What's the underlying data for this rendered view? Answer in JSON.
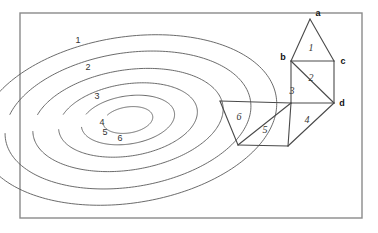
{
  "figure": {
    "width": 378,
    "height": 233,
    "background_color": "#ffffff",
    "frame": {
      "x": 20,
      "y": 13,
      "width": 342,
      "height": 205,
      "stroke_color": "#8a8a8a"
    },
    "colors": {
      "contour_stroke": "#5a5a5a",
      "mesh_stroke": "#4a4a4a",
      "label_text": "#333333",
      "vertex_text": "#111111"
    }
  },
  "contours": {
    "description": "six nested concentric tilted ellipses, outermost labelled 1 through innermost labelled 6",
    "center_x": 128,
    "center_y": 120,
    "rotation_deg": -9,
    "levels": [
      {
        "label": "1",
        "rx": 150,
        "ry": 83,
        "label_x": 78,
        "label_y": 41,
        "gap_start_deg": 185,
        "gap_end_deg": 199
      },
      {
        "label": "2",
        "rx": 124,
        "ry": 67,
        "label_x": 88,
        "label_y": 68,
        "gap_start_deg": 185,
        "gap_end_deg": 201
      },
      {
        "label": "3",
        "rx": 96,
        "ry": 50,
        "label_x": 97,
        "label_y": 97,
        "gap_start_deg": 184,
        "gap_end_deg": 203
      },
      {
        "label": "4",
        "rx": 70,
        "ry": 36,
        "label_x": 102,
        "label_y": 123,
        "gap_start_deg": 182,
        "gap_end_deg": 206
      },
      {
        "label": "5",
        "rx": 47,
        "ry": 24,
        "label_x": 105,
        "label_y": 133,
        "gap_start_deg": 180,
        "gap_end_deg": 211
      },
      {
        "label": "6",
        "rx": 25,
        "ry": 13,
        "label_x": 120,
        "label_y": 139,
        "gap_start_deg": 176,
        "gap_end_deg": 219
      }
    ]
  },
  "mesh": {
    "description": "triangulated strip of six triangles overlaying the contour map",
    "points": {
      "a": {
        "x": 310,
        "y": 19
      },
      "b": {
        "x": 291,
        "y": 61
      },
      "c": {
        "x": 334,
        "y": 61
      },
      "d": {
        "x": 334,
        "y": 103
      },
      "e": {
        "x": 291,
        "y": 103
      },
      "f": {
        "x": 220,
        "y": 101
      },
      "g": {
        "x": 238,
        "y": 145
      },
      "h": {
        "x": 288,
        "y": 146
      }
    },
    "triangles": [
      {
        "label": "1",
        "vertices": [
          "a",
          "b",
          "c"
        ],
        "label_x": 311,
        "label_y": 49
      },
      {
        "label": "2",
        "vertices": [
          "b",
          "c",
          "d"
        ],
        "label_x": 311,
        "label_y": 79
      },
      {
        "label": "3",
        "vertices": [
          "b",
          "d",
          "e"
        ],
        "label_x": 292,
        "label_y": 92
      },
      {
        "label": "4",
        "vertices": [
          "e",
          "d",
          "h"
        ],
        "label_x": 307,
        "label_y": 121
      },
      {
        "label": "5",
        "vertices": [
          "e",
          "g",
          "h"
        ],
        "label_x": 265,
        "label_y": 131
      },
      {
        "label": "6",
        "vertices": [
          "f",
          "e",
          "g"
        ],
        "label_x": 239,
        "label_y": 118
      }
    ],
    "vertex_labels": [
      {
        "text": "a",
        "x": 318,
        "y": 14
      },
      {
        "text": "b",
        "x": 283,
        "y": 58
      },
      {
        "text": "c",
        "x": 343,
        "y": 62
      },
      {
        "text": "d",
        "x": 342,
        "y": 104
      }
    ]
  }
}
